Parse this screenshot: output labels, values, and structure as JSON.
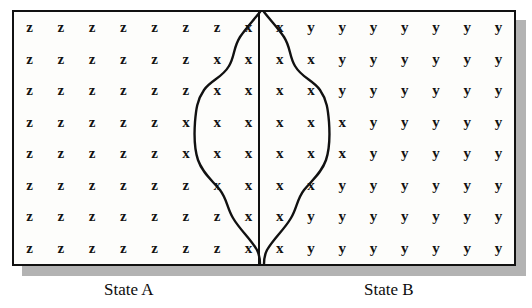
{
  "figure": {
    "colors": {
      "ink": "#111111",
      "paper": "#fdfdfb",
      "shadow": "#b3b3b3"
    },
    "panels": [
      {
        "id": "state-a",
        "label": "State A"
      },
      {
        "id": "state-b",
        "label": "State B"
      }
    ],
    "grid": {
      "rows": 8,
      "columns": 16,
      "divider_after_column": 8,
      "cells": [
        [
          "z",
          "z",
          "z",
          "z",
          "z",
          "z",
          "z",
          "x",
          "x",
          "y",
          "y",
          "y",
          "y",
          "y",
          "y",
          "y"
        ],
        [
          "z",
          "z",
          "z",
          "z",
          "z",
          "z",
          "x",
          "x",
          "x",
          "x",
          "y",
          "y",
          "y",
          "y",
          "y",
          "y"
        ],
        [
          "z",
          "z",
          "z",
          "z",
          "z",
          "z",
          "x",
          "x",
          "x",
          "x",
          "y",
          "y",
          "y",
          "y",
          "y",
          "y"
        ],
        [
          "z",
          "z",
          "z",
          "z",
          "z",
          "x",
          "x",
          "x",
          "x",
          "x",
          "x",
          "y",
          "y",
          "y",
          "y",
          "y"
        ],
        [
          "z",
          "z",
          "z",
          "z",
          "z",
          "x",
          "x",
          "x",
          "x",
          "x",
          "x",
          "y",
          "y",
          "y",
          "y",
          "y"
        ],
        [
          "z",
          "z",
          "z",
          "z",
          "z",
          "z",
          "x",
          "x",
          "x",
          "x",
          "y",
          "y",
          "y",
          "y",
          "y",
          "y"
        ],
        [
          "z",
          "z",
          "z",
          "z",
          "z",
          "z",
          "z",
          "x",
          "x",
          "y",
          "y",
          "y",
          "y",
          "y",
          "y",
          "y"
        ],
        [
          "z",
          "z",
          "z",
          "z",
          "z",
          "z",
          "z",
          "x",
          "x",
          "y",
          "y",
          "y",
          "y",
          "y",
          "y",
          "y"
        ]
      ]
    },
    "boundary_curve": {
      "description": "closed hand-drawn contour enclosing the x region, pinched at the top and bottom edges on the divider",
      "left_path": "M 246 0 C 238 10, 232 16, 226 25 C 219 36, 221 44, 215 54 C 208 66, 197 68, 190 78 C 183 88, 182 98, 181 110 C 180 124, 180 136, 184 148 C 189 162, 198 168, 206 178 C 213 187, 213 196, 219 206 C 226 218, 236 226, 243 238 C 246 244, 246 248, 246 252",
      "right_path": "M 250 0 C 258 10, 264 16, 270 25 C 277 36, 275 44, 281 54 C 288 66, 299 68, 306 78 C 313 88, 314 98, 315 110 C 316 124, 316 136, 312 148 C 307 162, 298 168, 290 178 C 283 187, 283 196, 277 206 C 270 218, 260 226, 253 238 C 250 244, 250 248, 250 252"
    }
  }
}
